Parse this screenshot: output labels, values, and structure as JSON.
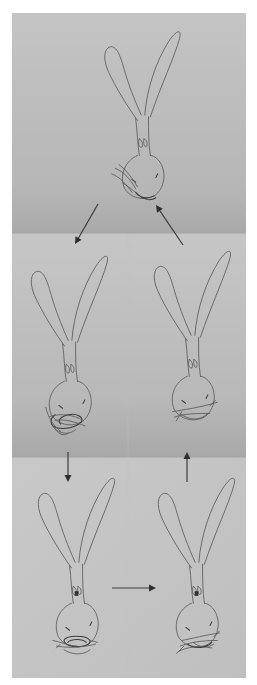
{
  "figure": {
    "paper_color": "#c2c2c2",
    "paper_shadow_color": "#b4b4b4",
    "pencil_color": "#5a5a5a",
    "arrow_color": "#3c3c3c",
    "stages": [
      {
        "id": "stage-1",
        "position": "top-center",
        "mouth_state": "grass strands protruding from mouth, sticking out left"
      },
      {
        "id": "stage-2",
        "position": "middle-left",
        "mouth_state": "mouth full of tangled grass"
      },
      {
        "id": "stage-3",
        "position": "middle-right",
        "mouth_state": "a few whisker-like grass strands"
      },
      {
        "id": "stage-4",
        "position": "bottom-left",
        "mouth_state": "round mouth wrapped with grass loop"
      },
      {
        "id": "stage-5",
        "position": "bottom-right",
        "mouth_state": "grass tangled below mouth"
      }
    ],
    "arrows": [
      {
        "from": "stage-1",
        "to": "stage-2",
        "direction": "down-left"
      },
      {
        "from": "stage-2",
        "to": "stage-4",
        "direction": "down"
      },
      {
        "from": "stage-4",
        "to": "stage-5",
        "direction": "right"
      },
      {
        "from": "stage-5",
        "to": "stage-3",
        "direction": "up"
      },
      {
        "from": "stage-3",
        "to": "stage-1",
        "direction": "up-left"
      }
    ]
  }
}
